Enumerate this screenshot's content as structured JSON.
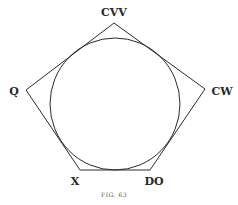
{
  "figure": {
    "caption": "FIG. 63",
    "stroke_color": "#2a2a2a",
    "vertices": {
      "top": "CVV",
      "left": "Q",
      "right": "CW",
      "bottom_left": "X",
      "bottom_right": "DO"
    },
    "shapes": [
      "pentagon",
      "inscribed-circle"
    ]
  }
}
